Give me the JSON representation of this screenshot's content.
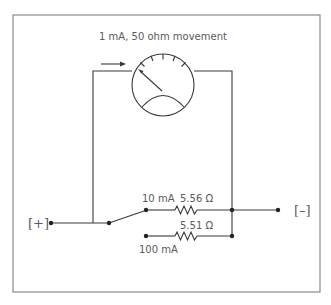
{
  "diagram": {
    "meter": {
      "label": "1 mA, 50 ohm movement"
    },
    "terminals": {
      "positive": "[+]",
      "negative": "[–]"
    },
    "ranges": [
      {
        "label": "10 mA",
        "shunt": "5.56 Ω"
      },
      {
        "label": "100 mA",
        "shunt": "5.51 Ω"
      }
    ],
    "colors": {
      "wire": "#3a3a3a",
      "frame": "#8a8a8a",
      "text": "#5a5a5a"
    }
  }
}
